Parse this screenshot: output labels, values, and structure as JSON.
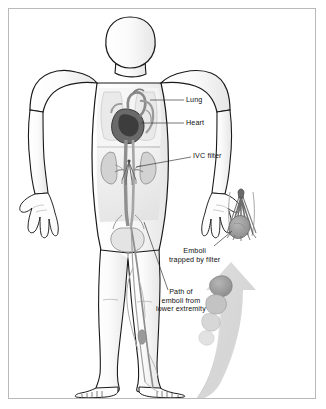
{
  "figure": {
    "background_color": "#ffffff",
    "border_color": "#b9b9b9",
    "width": 326,
    "height": 409
  },
  "labels": [
    {
      "id": "lung",
      "text": "Lung",
      "leader": "horizontal"
    },
    {
      "id": "heart",
      "text": "Heart",
      "leader": "horizontal"
    },
    {
      "id": "ivc",
      "text": "IVC filter",
      "leader": "horizontal"
    },
    {
      "id": "emboli",
      "text": "Emboli\ntrapped by filter",
      "leader": "diagonal"
    },
    {
      "id": "path",
      "text": "Path of\nemboli from\nlower extremity",
      "leader": "diagonal"
    }
  ],
  "anatomy": {
    "body_outline_color": "#1a1a1a",
    "body_fill_color": "#fdfdfd",
    "body_shade_color": "#ededed",
    "organ_shade_color": "#9a9a9a",
    "heart_dark_color": "#4a4a4a",
    "vessel_color": "#6f6f6f",
    "arrow_color": "#d6d6d6",
    "clot_color": "#9d9d9d",
    "parts": [
      "head",
      "neck",
      "torso",
      "left-arm",
      "right-arm",
      "left-hand",
      "right-hand",
      "left-leg",
      "right-leg",
      "left-foot",
      "right-foot",
      "lungs",
      "heart",
      "kidneys",
      "inferior-vena-cava",
      "aorta",
      "bladder",
      "femoral-veins",
      "ivc-filter",
      "trapped-emboli"
    ]
  },
  "inset": {
    "name": "ivc-filter-detail",
    "description": "Enlarged cone-shaped vena cava filter with struts and trapped clot"
  },
  "flow_arrow": {
    "name": "embolus-path-arrow",
    "direction": "up",
    "description": "Curved arrow showing emboli travelling from lower extremity toward the filter"
  }
}
